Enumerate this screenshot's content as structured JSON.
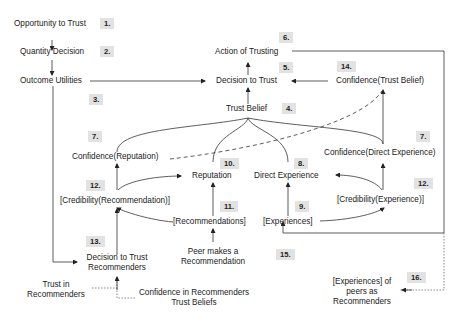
{
  "diagram": {
    "type": "trust-process-flow",
    "nodes": {
      "opportunity_to_trust": "Opportunity to Trust",
      "quantity_decision": "Quantity Decision",
      "outcome_utilities": "Outcome Utilities",
      "action_of_trusting": "Action of Trusting",
      "decision_to_trust": "Decision to Trust",
      "confidence_trust_belief": "Confidence(Trust Belief)",
      "trust_belief": "Trust Belief",
      "confidence_reputation": "Confidence(Reputation)",
      "confidence_direct_experience": "Confidence(Direct Experience)",
      "reputation": "Reputation",
      "direct_experience": "Direct Experience",
      "credibility_recommendation": "[Credibility(Recommendation)]",
      "credibility_experience": "[Credibility(Experience)]",
      "recommendations": "[Recommendations]",
      "experiences": "[Experiences]",
      "decision_to_trust_recommenders_1": "Decision to Trust",
      "decision_to_trust_recommenders_2": "Recommenders",
      "peer_makes_recommendation_1": "Peer makes a",
      "peer_makes_recommendation_2": "Recommendation",
      "trust_in_recommenders_1": "Trust in",
      "trust_in_recommenders_2": "Recommenders",
      "confidence_in_recommenders_1": "Confidence in Recommenders",
      "confidence_in_recommenders_2": "Trust Beliefs",
      "experiences_of_peers_1": "[Experiences] of",
      "experiences_of_peers_2": "peers as",
      "experiences_of_peers_3": "Recommenders"
    },
    "badges": {
      "b1": "1.",
      "b2": "2.",
      "b3": "3.",
      "b4": "4.",
      "b5": "5.",
      "b6": "6.",
      "b7a": "7.",
      "b7b": "7.",
      "b8": "8.",
      "b9": "9.",
      "b10": "10.",
      "b11": "11.",
      "b12a": "12.",
      "b12b": "12.",
      "b13": "13.",
      "b14": "14.",
      "b15": "15.",
      "b16": "16."
    },
    "colors": {
      "line": "#333333",
      "badge_bg": "#e2e2e2",
      "text": "#222222",
      "frame": "#888888"
    }
  }
}
